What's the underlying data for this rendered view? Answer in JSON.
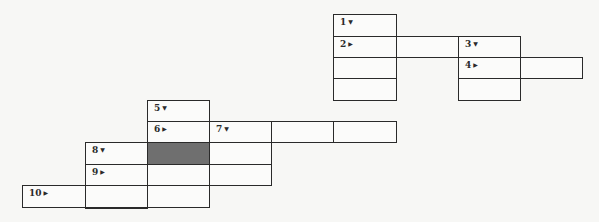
{
  "puzzle": {
    "cells": [
      {
        "id": "r0c4",
        "col": 4,
        "row": 0,
        "clue": "1",
        "dir": "down"
      },
      {
        "id": "r1c4",
        "col": 4,
        "row": 1,
        "clue": "2",
        "dir": "across"
      },
      {
        "id": "r1c5",
        "col": 5,
        "row": 1
      },
      {
        "id": "r1c6",
        "col": 6,
        "row": 1,
        "clue": "3",
        "dir": "down"
      },
      {
        "id": "r2c4",
        "col": 4,
        "row": 2
      },
      {
        "id": "r2c6",
        "col": 6,
        "row": 2,
        "clue": "4",
        "dir": "across"
      },
      {
        "id": "r2c7",
        "col": 7,
        "row": 2
      },
      {
        "id": "r3c4",
        "col": 4,
        "row": 3
      },
      {
        "id": "r3c6",
        "col": 6,
        "row": 3
      },
      {
        "id": "r4c1",
        "col": 1,
        "row": 4,
        "clue": "5",
        "dir": "down"
      },
      {
        "id": "r5c1",
        "col": 1,
        "row": 5,
        "clue": "6",
        "dir": "across"
      },
      {
        "id": "r5c2",
        "col": 2,
        "row": 5,
        "clue": "7",
        "dir": "down"
      },
      {
        "id": "r5c3",
        "col": 3,
        "row": 5
      },
      {
        "id": "r5c4",
        "col": 4,
        "row": 5
      },
      {
        "id": "r6c0",
        "col": 0,
        "row": 6,
        "clue": "8",
        "dir": "down"
      },
      {
        "id": "r6c1",
        "col": 1,
        "row": 6,
        "shaded": true
      },
      {
        "id": "r6c2",
        "col": 2,
        "row": 6
      },
      {
        "id": "r7c0",
        "col": 0,
        "row": 7,
        "clue": "9",
        "dir": "across"
      },
      {
        "id": "r7c1",
        "col": 1,
        "row": 7
      },
      {
        "id": "r7c2",
        "col": 2,
        "row": 7
      },
      {
        "id": "r8cm1",
        "col": -1,
        "row": 8,
        "clue": "10",
        "dir": "across"
      },
      {
        "id": "r8c0",
        "col": 0,
        "row": 8
      },
      {
        "id": "r8c1",
        "col": 1,
        "row": 8
      },
      {
        "id": "r9c0",
        "col": 0,
        "row": 9
      }
    ],
    "arrows": {
      "down": "▼",
      "across": "▶"
    },
    "colors": {
      "line": "#2a2a2a",
      "shaded": "#6f6f6f",
      "paper": "#f7f7f5"
    }
  }
}
